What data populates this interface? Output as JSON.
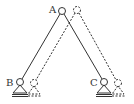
{
  "diagram": {
    "labels": {
      "a": "A",
      "b": "B",
      "c": "C"
    },
    "colors": {
      "stroke": "#333333",
      "background": "#ffffff"
    },
    "nodes": {
      "A": {
        "x": 62,
        "y": 11
      },
      "B": {
        "x": 20,
        "y": 82
      },
      "C": {
        "x": 104,
        "y": 82
      },
      "A_displaced": {
        "x": 77,
        "y": 10
      },
      "B_displaced": {
        "x": 34,
        "y": 83
      },
      "C_displaced": {
        "x": 118,
        "y": 83
      }
    }
  }
}
